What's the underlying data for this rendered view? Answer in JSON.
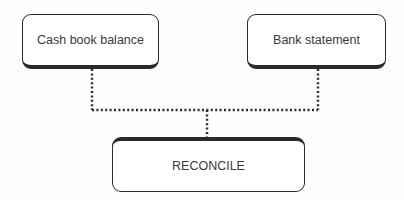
{
  "diagram": {
    "nodes": [
      {
        "id": "cash",
        "label": "Cash book balance"
      },
      {
        "id": "bank",
        "label": "Bank statement"
      },
      {
        "id": "reconcile",
        "label": "RECONCILE"
      }
    ],
    "edges": [
      {
        "from": "cash",
        "to": "reconcile",
        "style": "dotted"
      },
      {
        "from": "bank",
        "to": "reconcile",
        "style": "dotted"
      }
    ],
    "colors": {
      "stroke": "#2a2a2a",
      "text": "#3a3a3a",
      "background": "#fdfdfd"
    }
  }
}
